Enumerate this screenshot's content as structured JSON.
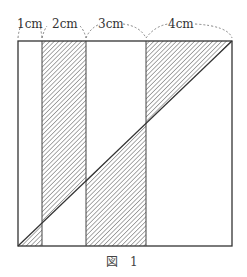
{
  "figure": {
    "caption": "図　1",
    "stroke_color": "#333333",
    "hatch_color": "#555555",
    "segments": [
      {
        "label": "1cm",
        "width_cm": 1
      },
      {
        "label": "2cm",
        "width_cm": 2
      },
      {
        "label": "3cm",
        "width_cm": 3
      },
      {
        "label": "4cm",
        "width_cm": 4
      }
    ],
    "shaded_regions": [
      "strip-1 below diagonal",
      "strip-2 above diagonal",
      "strip-3 below diagonal",
      "strip-4 above diagonal"
    ]
  }
}
